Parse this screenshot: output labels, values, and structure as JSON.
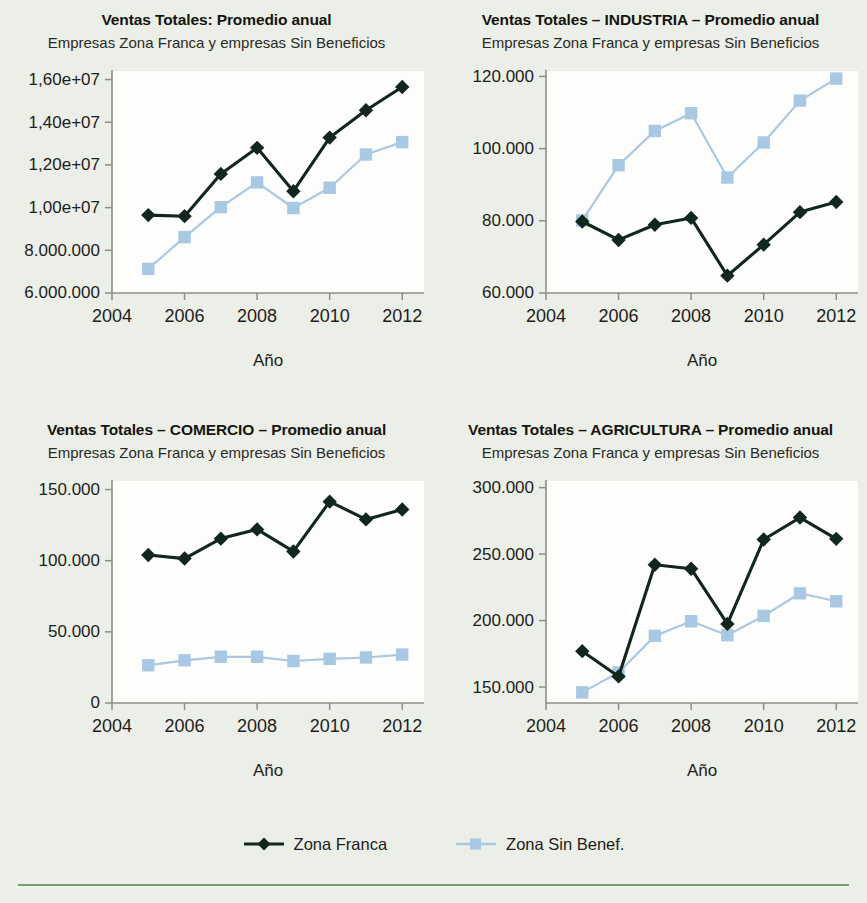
{
  "figure": {
    "x_axis_name": "Año",
    "legend": {
      "items": [
        {
          "label": "Zona Franca",
          "marker": "diamond",
          "color": "#11261d",
          "name": "zona-franca"
        },
        {
          "label": "Zona Sin Benef.",
          "marker": "square",
          "color": "#a9c8e3",
          "name": "zona-sin-benef"
        }
      ]
    },
    "colors": {
      "page_background": "#eceee8",
      "plot_background": "#fdfdfc",
      "axis": "#8d8f87",
      "series_dark": "#11261d",
      "series_light": "#a9c8e3",
      "bottom_rule": "#7d9b6f"
    }
  },
  "chart_data": [
    {
      "type": "line",
      "name": "ventas-totales-general",
      "title": "Ventas Totales: Promedio anual",
      "subtitle": "Empresas Zona Franca y empresas Sin Beneficios",
      "xlabel": "Año",
      "ylabel": "",
      "x": [
        2005,
        2006,
        2007,
        2008,
        2009,
        2010,
        2011,
        2012
      ],
      "xlim": [
        2004,
        2012.6
      ],
      "xticks": [
        2004,
        2006,
        2008,
        2010,
        2012
      ],
      "xticklabels": [
        "2004",
        "2006",
        "2008",
        "2010",
        "2012"
      ],
      "ylim": [
        6000000,
        16400000
      ],
      "yticks": [
        6000000,
        8000000,
        10000000,
        12000000,
        14000000,
        16000000
      ],
      "yticklabels": [
        "6.000.000",
        "8.000.000",
        "1,00e+07",
        "1,20e+07",
        "1,40e+07",
        "1,60e+07"
      ],
      "grid": false,
      "legend_position": "below-figure",
      "series": [
        {
          "name": "Zona Franca",
          "values": [
            9650000,
            9600000,
            11580000,
            12800000,
            10770000,
            13280000,
            14560000,
            15650000
          ]
        },
        {
          "name": "Zona Sin Benef.",
          "values": [
            7130000,
            8620000,
            10020000,
            11180000,
            9980000,
            10930000,
            12490000,
            13070000
          ]
        }
      ]
    },
    {
      "type": "line",
      "name": "ventas-totales-industria",
      "title": "Ventas Totales – INDUSTRIA – Promedio anual",
      "subtitle": "Empresas Zona Franca y empresas Sin Beneficios",
      "xlabel": "Año",
      "ylabel": "",
      "x": [
        2005,
        2006,
        2007,
        2008,
        2009,
        2010,
        2011,
        2012
      ],
      "xlim": [
        2004,
        2012.6
      ],
      "xticks": [
        2004,
        2006,
        2008,
        2010,
        2012
      ],
      "xticklabels": [
        "2004",
        "2006",
        "2008",
        "2010",
        "2012"
      ],
      "ylim": [
        60000,
        121500
      ],
      "yticks": [
        60000,
        80000,
        100000,
        120000
      ],
      "yticklabels": [
        "60.000",
        "80.000",
        "100.000",
        "120.000"
      ],
      "grid": false,
      "legend_position": "below-figure",
      "series": [
        {
          "name": "Zona Franca",
          "values": [
            79800,
            74700,
            78900,
            80800,
            64800,
            73400,
            82400,
            85200
          ]
        },
        {
          "name": "Zona Sin Benef.",
          "values": [
            80100,
            95400,
            104900,
            109800,
            92000,
            101700,
            113300,
            119400
          ]
        }
      ]
    },
    {
      "type": "line",
      "name": "ventas-totales-comercio",
      "title": "Ventas Totales – COMERCIO – Promedio anual",
      "subtitle": "Empresas Zona Franca  y empresas Sin Beneficios",
      "xlabel": "Año",
      "ylabel": "",
      "x": [
        2005,
        2006,
        2007,
        2008,
        2009,
        2010,
        2011,
        2012
      ],
      "xlim": [
        2004,
        2012.6
      ],
      "xticks": [
        2004,
        2006,
        2008,
        2010,
        2012
      ],
      "xticklabels": [
        "2004",
        "2006",
        "2008",
        "2010",
        "2012"
      ],
      "ylim": [
        0,
        156000
      ],
      "yticks": [
        0,
        50000,
        100000,
        150000
      ],
      "yticklabels": [
        "0",
        "50.000",
        "100.000",
        "150.000"
      ],
      "grid": false,
      "legend_position": "below-figure",
      "series": [
        {
          "name": "Zona Franca",
          "values": [
            104000,
            101500,
            115500,
            122000,
            106500,
            141500,
            129000,
            136000
          ]
        },
        {
          "name": "Zona Sin Benef.",
          "values": [
            26500,
            30000,
            32500,
            32500,
            29500,
            31000,
            32000,
            34000
          ]
        }
      ]
    },
    {
      "type": "line",
      "name": "ventas-totales-agricultura",
      "title": "Ventas Totales – AGRICULTURA – Promedio anual",
      "subtitle": "Empresas Zona Franca y empresas Sin Beneficios",
      "xlabel": "Año",
      "ylabel": "",
      "x": [
        2005,
        2006,
        2007,
        2008,
        2009,
        2010,
        2011,
        2012
      ],
      "xlim": [
        2004,
        2012.6
      ],
      "xticks": [
        2004,
        2006,
        2008,
        2010,
        2012
      ],
      "xticklabels": [
        "2004",
        "2006",
        "2008",
        "2010",
        "2012"
      ],
      "ylim": [
        138000,
        305000
      ],
      "yticks": [
        150000,
        200000,
        250000,
        300000
      ],
      "yticklabels": [
        "150.000",
        "200.000",
        "250.000",
        "300.000"
      ],
      "grid": false,
      "legend_position": "below-figure",
      "series": [
        {
          "name": "Zona Franca",
          "values": [
            177000,
            158000,
            242000,
            239000,
            197500,
            261000,
            277500,
            261500
          ]
        },
        {
          "name": "Zona Sin Benef.",
          "values": [
            146000,
            161000,
            188500,
            199500,
            189000,
            203500,
            220500,
            214500
          ]
        }
      ]
    }
  ]
}
